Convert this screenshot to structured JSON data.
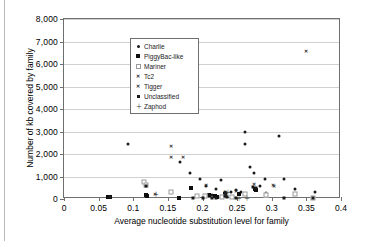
{
  "chart_data": {
    "type": "scatter",
    "title": "",
    "xlabel": "Average nucleotide substitution level for family",
    "ylabel": "Number of kb covered by family",
    "xlim": [
      0,
      0.4
    ],
    "ylim": [
      0,
      8000
    ],
    "xticks": [
      0,
      0.05,
      0.1,
      0.15,
      0.2,
      0.25,
      0.3,
      0.35,
      0.4
    ],
    "xtick_labels": [
      "0",
      "0.05",
      "0.1",
      "0.15",
      "0.2",
      "0.25",
      "0.3",
      "0.35",
      "0.4"
    ],
    "yticks": [
      0,
      1000,
      2000,
      3000,
      4000,
      5000,
      6000,
      7000,
      8000
    ],
    "ytick_labels": [
      "0",
      "1,000",
      "2,000",
      "3,000",
      "4,000",
      "5,000",
      "6,000",
      "7,000",
      "8,000"
    ],
    "grid": "horizontal",
    "legend_position": "top-left-inside",
    "series": [
      {
        "name": "Charlie",
        "marker": "dot",
        "color": "#1a1a1a",
        "points": [
          [
            0.093,
            2450
          ],
          [
            0.168,
            1650
          ],
          [
            0.182,
            1150
          ],
          [
            0.196,
            900
          ],
          [
            0.205,
            600
          ],
          [
            0.213,
            160
          ],
          [
            0.219,
            430
          ],
          [
            0.226,
            840
          ],
          [
            0.233,
            300
          ],
          [
            0.241,
            290
          ],
          [
            0.248,
            400
          ],
          [
            0.255,
            330
          ],
          [
            0.262,
            2980
          ],
          [
            0.262,
            2460
          ],
          [
            0.268,
            1440
          ],
          [
            0.275,
            1140
          ],
          [
            0.283,
            560
          ],
          [
            0.29,
            900
          ],
          [
            0.291,
            250
          ],
          [
            0.31,
            2800
          ],
          [
            0.318,
            900
          ],
          [
            0.333,
            450
          ],
          [
            0.362,
            300
          ]
        ]
      },
      {
        "name": "PiggyBac-like",
        "marker": "square-large",
        "color": "#0d0d0d",
        "points": [
          [
            0.063,
            70
          ],
          [
            0.067,
            90
          ],
          [
            0.118,
            160
          ],
          [
            0.12,
            120
          ],
          [
            0.166,
            60
          ],
          [
            0.184,
            510
          ],
          [
            0.21,
            200
          ],
          [
            0.218,
            120
          ],
          [
            0.221,
            110
          ],
          [
            0.232,
            210
          ],
          [
            0.252,
            230
          ],
          [
            0.276,
            430
          ],
          [
            0.277,
            390
          ]
        ]
      },
      {
        "name": "Mariner",
        "marker": "open-square",
        "color": "#9a9a9a",
        "points": [
          [
            0.116,
            760
          ],
          [
            0.118,
            640
          ],
          [
            0.155,
            320
          ],
          [
            0.192,
            150
          ],
          [
            0.203,
            120
          ],
          [
            0.228,
            80
          ],
          [
            0.243,
            90
          ],
          [
            0.262,
            230
          ],
          [
            0.291,
            170
          ],
          [
            0.334,
            210
          ],
          [
            0.36,
            60
          ]
        ]
      },
      {
        "name": "Tc2",
        "marker": "x",
        "color": "#2b2b2b",
        "points": [
          [
            0.132,
            220
          ],
          [
            0.205,
            640
          ],
          [
            0.233,
            330
          ],
          [
            0.249,
            340
          ],
          [
            0.274,
            660
          ],
          [
            0.302,
            630
          ],
          [
            0.303,
            600
          ]
        ]
      },
      {
        "name": "Tigger",
        "marker": "x-small",
        "color": "#2b2b2b",
        "points": [
          [
            0.155,
            6960
          ],
          [
            0.167,
            4120
          ],
          [
            0.155,
            2340
          ],
          [
            0.155,
            1870
          ],
          [
            0.172,
            1880
          ],
          [
            0.35,
            6580
          ]
        ]
      },
      {
        "name": "Unclassified",
        "marker": "square",
        "color": "#1a1a1a",
        "points": [
          [
            0.066,
            80
          ],
          [
            0.118,
            580
          ],
          [
            0.186,
            60
          ],
          [
            0.2,
            60
          ],
          [
            0.214,
            60
          ],
          [
            0.219,
            60
          ],
          [
            0.233,
            130
          ],
          [
            0.234,
            250
          ],
          [
            0.236,
            70
          ],
          [
            0.248,
            60
          ],
          [
            0.273,
            520
          ],
          [
            0.277,
            490
          ],
          [
            0.318,
            60
          ],
          [
            0.36,
            50
          ]
        ]
      },
      {
        "name": "Zaphod",
        "marker": "plus",
        "color": "#2b2b2b",
        "points": [
          [
            0.132,
            230
          ],
          [
            0.233,
            190
          ],
          [
            0.236,
            300
          ],
          [
            0.252,
            60
          ],
          [
            0.263,
            60
          ]
        ]
      }
    ]
  },
  "legend": {
    "items": [
      {
        "label": "Charlie",
        "marker": "dot"
      },
      {
        "label": "PiggyBac-like",
        "marker": "square-large"
      },
      {
        "label": "Mariner",
        "marker": "open-square"
      },
      {
        "label": "Tc2",
        "marker": "x"
      },
      {
        "label": "Tigger",
        "marker": "x-small"
      },
      {
        "label": "Unclassified",
        "marker": "square"
      },
      {
        "label": "Zaphod",
        "marker": "plus"
      }
    ]
  },
  "axes": {
    "y_title": "Number of kb covered by family",
    "x_title": "Average nucleotide substitution level for family"
  },
  "colors": {
    "frame": "#6f6f6f",
    "grid": "#d0d0d0",
    "marker_dark": "#1a1a1a",
    "marker_mid": "#2b2b2b",
    "marker_light": "#9a9a9a",
    "background": "#ffffff"
  }
}
